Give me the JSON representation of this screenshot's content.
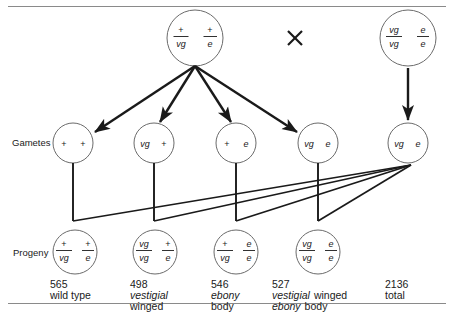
{
  "diagram": {
    "type": "genetic-testcross-pedigree",
    "cross_symbol": "×",
    "row_labels": {
      "gametes": "Gametes",
      "progeny": "Progeny"
    },
    "parents": [
      {
        "name": "parent-female-dihybrid",
        "left_gene": {
          "top": "+",
          "bottom": "vg"
        },
        "right_gene": {
          "top": "+",
          "bottom": "e"
        }
      },
      {
        "name": "parent-male-tester",
        "left_gene": {
          "top": "vg",
          "bottom": "vg"
        },
        "right_gene": {
          "top": "e",
          "bottom": "e"
        }
      }
    ],
    "gametes": [
      {
        "name": "gamete-vg-plus-e-plus",
        "left": "+",
        "right": "+"
      },
      {
        "name": "gamete-vg-e-plus",
        "left": "vg",
        "right": "+"
      },
      {
        "name": "gamete-plus-e",
        "left": "+",
        "right": "e"
      },
      {
        "name": "gamete-vg-e",
        "left": "vg",
        "right": "e"
      }
    ],
    "tester_gamete": {
      "name": "tester-gamete-vg-e",
      "left": "vg",
      "right": "e"
    },
    "progeny": [
      {
        "name": "progeny-wild-type",
        "left_gene": {
          "top": "+",
          "bottom": "vg"
        },
        "right_gene": {
          "top": "+",
          "bottom": "e"
        },
        "count": "565",
        "phenotype_lines": [
          [
            {
              "text": "wild type",
              "italic": false
            }
          ]
        ]
      },
      {
        "name": "progeny-vestigial-winged",
        "left_gene": {
          "top": "vg",
          "bottom": "vg"
        },
        "right_gene": {
          "top": "+",
          "bottom": "e"
        },
        "count": "498",
        "phenotype_lines": [
          [
            {
              "text": "vestigial",
              "italic": true
            }
          ],
          [
            {
              "text": "winged",
              "italic": false
            }
          ]
        ]
      },
      {
        "name": "progeny-ebony-body",
        "left_gene": {
          "top": "+",
          "bottom": "vg"
        },
        "right_gene": {
          "top": "e",
          "bottom": "e"
        },
        "count": "546",
        "phenotype_lines": [
          [
            {
              "text": "ebony",
              "italic": true
            }
          ],
          [
            {
              "text": "body",
              "italic": false
            }
          ]
        ]
      },
      {
        "name": "progeny-vestigial-winged-ebony-body",
        "left_gene": {
          "top": "vg",
          "bottom": "vg"
        },
        "right_gene": {
          "top": "e",
          "bottom": "e"
        },
        "count": "527",
        "phenotype_lines": [
          [
            {
              "text": "vestigial",
              "italic": true
            },
            {
              "text": "winged",
              "italic": false
            }
          ],
          [
            {
              "text": "ebony",
              "italic": true
            },
            {
              "text": "body",
              "italic": false
            }
          ]
        ]
      }
    ],
    "total": {
      "name": "progeny-total",
      "count": "2136",
      "label": "total"
    }
  }
}
